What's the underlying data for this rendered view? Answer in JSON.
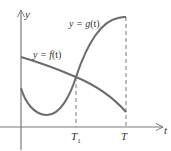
{
  "diagram": {
    "axes": {
      "y_label": "y",
      "x_label": "t"
    },
    "curves": [
      {
        "name": "f",
        "label": "y = f(t)",
        "label_prefix": "y = ",
        "label_func": "f",
        "label_arg": "(t)",
        "description": "decreasing curve"
      },
      {
        "name": "g",
        "label": "y = g(t)",
        "label_prefix": "y = ",
        "label_func": "g",
        "label_arg": "(t)",
        "description": "dips to a minimum then rises steeply"
      }
    ],
    "markers": [
      {
        "label": "T",
        "subscript": "1",
        "description": "intersection of f and g"
      },
      {
        "label": "T",
        "subscript": "",
        "description": "right endpoint"
      }
    ],
    "colors": {
      "curve": "#6b6b6b",
      "axis": "#7a7a7a",
      "text": "#333333"
    }
  }
}
